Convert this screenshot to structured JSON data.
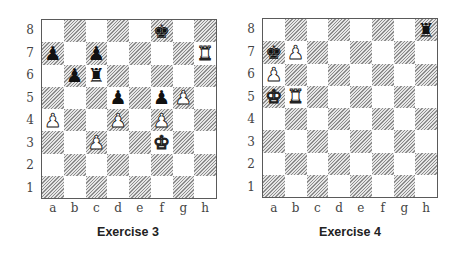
{
  "files": [
    "a",
    "b",
    "c",
    "d",
    "e",
    "f",
    "g",
    "h"
  ],
  "ranks": [
    "8",
    "7",
    "6",
    "5",
    "4",
    "3",
    "2",
    "1"
  ],
  "diagrams": [
    {
      "caption": "Exercise 3",
      "pieces": [
        {
          "square": "f8",
          "color": "black",
          "type": "king"
        },
        {
          "square": "a7",
          "color": "black",
          "type": "pawn"
        },
        {
          "square": "c7",
          "color": "black",
          "type": "pawn"
        },
        {
          "square": "h7",
          "color": "white",
          "type": "rook"
        },
        {
          "square": "b6",
          "color": "black",
          "type": "pawn"
        },
        {
          "square": "c6",
          "color": "black",
          "type": "rook"
        },
        {
          "square": "d5",
          "color": "black",
          "type": "pawn"
        },
        {
          "square": "f5",
          "color": "black",
          "type": "pawn"
        },
        {
          "square": "g5",
          "color": "white",
          "type": "pawn"
        },
        {
          "square": "a4",
          "color": "white",
          "type": "pawn"
        },
        {
          "square": "d4",
          "color": "white",
          "type": "pawn"
        },
        {
          "square": "f4",
          "color": "white",
          "type": "pawn"
        },
        {
          "square": "c3",
          "color": "white",
          "type": "pawn"
        },
        {
          "square": "f3",
          "color": "white",
          "type": "king"
        }
      ]
    },
    {
      "caption": "Exercise 4",
      "pieces": [
        {
          "square": "h8",
          "color": "black",
          "type": "rook"
        },
        {
          "square": "a7",
          "color": "black",
          "type": "king"
        },
        {
          "square": "b7",
          "color": "white",
          "type": "pawn"
        },
        {
          "square": "a6",
          "color": "white",
          "type": "pawn"
        },
        {
          "square": "a5",
          "color": "white",
          "type": "king"
        },
        {
          "square": "b5",
          "color": "white",
          "type": "rook"
        }
      ]
    }
  ],
  "glyphs": {
    "king": "♚",
    "queen": "♛",
    "rook": "♜",
    "bishop": "♝",
    "knight": "♞",
    "pawn": "♟"
  }
}
